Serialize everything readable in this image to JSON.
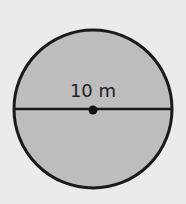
{
  "figure": {
    "shape": "circle",
    "diameter_label": "10 m",
    "colors": {
      "background": "#ebebeb",
      "fill": "#bdbdbd",
      "stroke": "#1a1a1a"
    }
  }
}
